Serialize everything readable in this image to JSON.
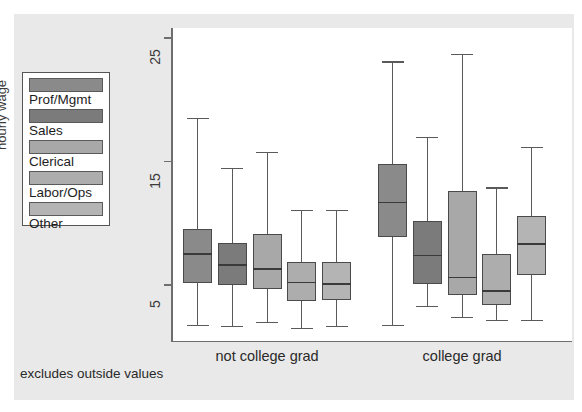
{
  "chart_data": {
    "type": "box",
    "title": "",
    "xlabel": "",
    "ylabel": "hourly wage",
    "ylim": [
      0,
      27
    ],
    "yticks": [
      5,
      15,
      25
    ],
    "ytick_labels": [
      "5",
      "15",
      "25"
    ],
    "grid": false,
    "footnote": "excludes outside values",
    "legend_position": "left-outside",
    "groups": [
      "not college grad",
      "college grad"
    ],
    "categories": [
      "Prof/Mgmt",
      "Sales",
      "Clerical",
      "Labor/Ops",
      "Other"
    ],
    "colors": [
      "#8a8a8a",
      "#7b7b7b",
      "#a8a8a8",
      "#adadad",
      "#b4b4b4"
    ],
    "series": [
      {
        "group": "not college grad",
        "boxes": [
          {
            "category": "Prof/Mgmt",
            "whisker_low": 1.8,
            "q1": 5.2,
            "median": 7.5,
            "q3": 9.5,
            "whisker_high": 18.5
          },
          {
            "category": "Sales",
            "whisker_low": 1.7,
            "q1": 5.0,
            "median": 6.6,
            "q3": 8.4,
            "whisker_high": 14.5
          },
          {
            "category": "Clerical",
            "whisker_low": 2.0,
            "q1": 4.7,
            "median": 6.3,
            "q3": 9.1,
            "whisker_high": 15.8
          },
          {
            "category": "Labor/Ops",
            "whisker_low": 1.5,
            "q1": 3.7,
            "median": 5.2,
            "q3": 6.9,
            "whisker_high": 11.1
          },
          {
            "category": "Other",
            "whisker_low": 1.7,
            "q1": 3.8,
            "median": 5.1,
            "q3": 6.9,
            "whisker_high": 11.1
          }
        ]
      },
      {
        "group": "college grad",
        "boxes": [
          {
            "category": "Prof/Mgmt",
            "whisker_low": 1.8,
            "q1": 8.9,
            "median": 11.7,
            "q3": 14.8,
            "whisker_high": 23.1
          },
          {
            "category": "Sales",
            "whisker_low": 3.3,
            "q1": 5.1,
            "median": 7.4,
            "q3": 10.2,
            "whisker_high": 17.0
          },
          {
            "category": "Clerical",
            "whisker_low": 2.4,
            "q1": 4.2,
            "median": 5.6,
            "q3": 12.6,
            "whisker_high": 23.7
          },
          {
            "category": "Labor/Ops",
            "whisker_low": 2.2,
            "q1": 3.4,
            "median": 4.5,
            "q3": 7.5,
            "whisker_high": 12.9
          },
          {
            "category": "Other",
            "whisker_low": 2.2,
            "q1": 5.8,
            "median": 8.3,
            "q3": 10.6,
            "whisker_high": 16.2
          }
        ]
      }
    ]
  },
  "legend": {
    "items": [
      {
        "label": "Prof/Mgmt",
        "color": "#8a8a8a"
      },
      {
        "label": "Sales",
        "color": "#7b7b7b"
      },
      {
        "label": "Clerical",
        "color": "#a8a8a8"
      },
      {
        "label": "Labor/Ops",
        "color": "#adadad"
      },
      {
        "label": "Other",
        "color": "#b4b4b4"
      }
    ]
  },
  "axis": {
    "y_title": "hourly wage",
    "y_tick_labels": [
      "25",
      "15",
      "5"
    ],
    "x_group_labels": [
      "not college grad",
      "college grad"
    ]
  },
  "footnote": "excludes outside values"
}
